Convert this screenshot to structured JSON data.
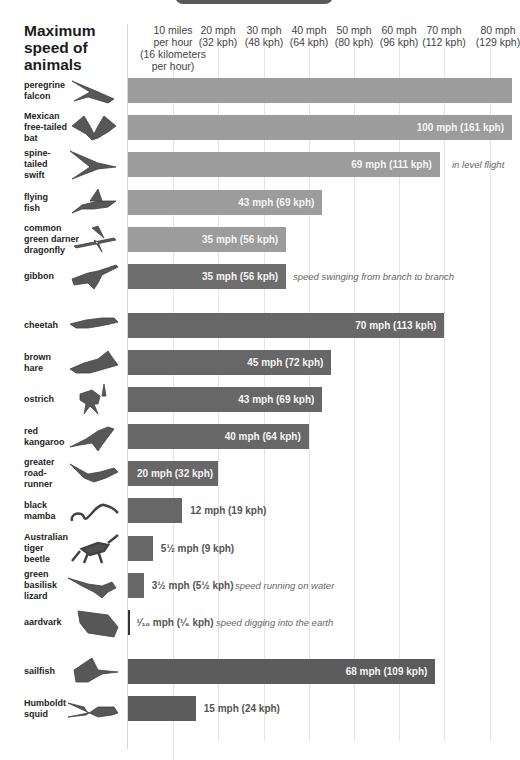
{
  "title": "Maximum speed of animals",
  "axis": {
    "ticks": [
      {
        "mph": 10,
        "label": "10 miles\nper hour\n(16 kilometers\nper hour)"
      },
      {
        "mph": 20,
        "label": "20 mph\n(32 kph)"
      },
      {
        "mph": 30,
        "label": "30 mph\n(48 kph)"
      },
      {
        "mph": 40,
        "label": "40 mph\n(64 kph)"
      },
      {
        "mph": 50,
        "label": "50 mph\n(80 kph)"
      },
      {
        "mph": 60,
        "label": "60 mph\n(96 kph)"
      },
      {
        "mph": 70,
        "label": "70 mph\n(112 kph)"
      },
      {
        "mph": 80,
        "label": "80 mph\n(129 kph)"
      }
    ]
  },
  "colors": {
    "flying_light": "#9c9c9c",
    "gibbon": "#6e6e6e",
    "land": "#676767",
    "water": "#5c5c5c",
    "grid": "#e4e4e4"
  },
  "rows": [
    {
      "name": "peregrine falcon",
      "label": "peregrine\nfalcon",
      "mph": 200,
      "text": "",
      "note": "",
      "group": "air",
      "icon": "falcon-icon"
    },
    {
      "name": "Mexican free-tailed bat",
      "label": "Mexican\nfree-tailed\nbat",
      "mph": 100,
      "text": "100 mph (161 kph)",
      "note": "",
      "group": "air",
      "icon": "bat-icon"
    },
    {
      "name": "spine-tailed swift",
      "label": "spine-\ntailed\nswift",
      "mph": 69,
      "text": "69 mph (111 kph)",
      "note": "in level flight",
      "group": "air",
      "icon": "swift-icon"
    },
    {
      "name": "flying fish",
      "label": "flying\nfish",
      "mph": 43,
      "text": "43 mph (69 kph)",
      "note": "",
      "group": "air",
      "icon": "flying-fish-icon"
    },
    {
      "name": "common green darner dragonfly",
      "label": "common\ngreen darner\ndragonfly",
      "mph": 35,
      "text": "35 mph (56 kph)",
      "note": "",
      "group": "air",
      "icon": "dragonfly-icon"
    },
    {
      "name": "gibbon",
      "label": "gibbon",
      "mph": 35,
      "text": "35 mph (56 kph)",
      "note": "speed swinging from branch to branch",
      "group": "gibbon",
      "icon": "gibbon-icon"
    },
    {
      "name": "cheetah",
      "label": "cheetah",
      "mph": 70,
      "text": "70 mph (113 kph)",
      "note": "",
      "group": "land",
      "icon": "cheetah-icon"
    },
    {
      "name": "brown hare",
      "label": "brown\nhare",
      "mph": 45,
      "text": "45 mph (72 kph)",
      "note": "",
      "group": "land",
      "icon": "hare-icon"
    },
    {
      "name": "ostrich",
      "label": "ostrich",
      "mph": 43,
      "text": "43 mph (69 kph)",
      "note": "",
      "group": "land",
      "icon": "ostrich-icon"
    },
    {
      "name": "red kangaroo",
      "label": "red\nkangaroo",
      "mph": 40,
      "text": "40 mph (64 kph)",
      "note": "",
      "group": "land",
      "icon": "kangaroo-icon"
    },
    {
      "name": "greater roadrunner",
      "label": "greater\nroad-\nrunner",
      "mph": 20,
      "text": "20 mph (32 kph)",
      "note": "",
      "group": "land",
      "icon": "roadrunner-icon"
    },
    {
      "name": "black mamba",
      "label": "black\nmamba",
      "mph": 12,
      "text": "12 mph (19 kph)",
      "note": "",
      "group": "land",
      "icon": "snake-icon"
    },
    {
      "name": "Australian tiger beetle",
      "label": "Australian\ntiger\nbeetle",
      "mph": 5.5,
      "text": "5½ mph (9 kph)",
      "note": "",
      "group": "land",
      "icon": "beetle-icon"
    },
    {
      "name": "green basilisk lizard",
      "label": "green\nbasilisk\nlizard",
      "mph": 3.5,
      "text": "3½ mph (5½ kph)",
      "note": "speed running on water",
      "group": "land",
      "icon": "lizard-icon"
    },
    {
      "name": "aardvark",
      "label": "aardvark",
      "mph": 0.1,
      "text": "¹⁄₁₀ mph (¹⁄₆ kph)",
      "note": "speed digging into the earth",
      "group": "land",
      "icon": "aardvark-icon"
    },
    {
      "name": "sailfish",
      "label": "sailfish",
      "mph": 68,
      "text": "68 mph (109 kph)",
      "note": "",
      "group": "water",
      "icon": "sailfish-icon"
    },
    {
      "name": "Humboldt squid",
      "label": "Humboldt\nsquid",
      "mph": 15,
      "text": "15 mph (24 kph)",
      "note": "",
      "group": "water",
      "icon": "squid-icon"
    }
  ],
  "chart_data": {
    "type": "bar",
    "orientation": "horizontal",
    "title": "Maximum speed of animals",
    "xlabel": "speed (mph / kph)",
    "ylabel": "",
    "xlim": [
      0,
      84
    ],
    "grid": true,
    "x_tick_labels": [
      "10 miles per hour (16 kilometers per hour)",
      "20 mph (32 kph)",
      "30 mph (48 kph)",
      "40 mph (64 kph)",
      "50 mph (80 kph)",
      "60 mph (96 kph)",
      "70 mph (112 kph)",
      "80 mph (129 kph)"
    ],
    "categories": [
      "peregrine falcon",
      "Mexican free-tailed bat",
      "spine-tailed swift",
      "flying fish",
      "common green darner dragonfly",
      "gibbon",
      "cheetah",
      "brown hare",
      "ostrich",
      "red kangaroo",
      "greater roadrunner",
      "black mamba",
      "Australian tiger beetle",
      "green basilisk lizard",
      "aardvark",
      "sailfish",
      "Humboldt squid"
    ],
    "series": [
      {
        "name": "max speed (mph)",
        "values": [
          200,
          100,
          69,
          43,
          35,
          35,
          70,
          45,
          43,
          40,
          20,
          12,
          5.5,
          3.5,
          0.1,
          68,
          15
        ]
      },
      {
        "name": "max speed (kph)",
        "values": [
          null,
          161,
          111,
          69,
          56,
          56,
          113,
          72,
          69,
          64,
          32,
          19,
          9,
          5.5,
          0.1667,
          109,
          24
        ]
      }
    ],
    "data_labels": [
      "",
      "100 mph (161 kph)",
      "69 mph (111 kph)",
      "43 mph (69 kph)",
      "35 mph (56 kph)",
      "35 mph (56 kph)",
      "70 mph (113 kph)",
      "45 mph (72 kph)",
      "43 mph (69 kph)",
      "40 mph (64 kph)",
      "20 mph (32 kph)",
      "12 mph (19 kph)",
      "5½ mph (9 kph)",
      "3½ mph (5½ kph)",
      "1/10 mph (1/6 kph)",
      "68 mph (109 kph)",
      "15 mph (24 kph)"
    ],
    "annotations": [
      {
        "category": "spine-tailed swift",
        "text": "in level flight"
      },
      {
        "category": "gibbon",
        "text": "speed swinging from branch to branch"
      },
      {
        "category": "green basilisk lizard",
        "text": "speed running on water"
      },
      {
        "category": "aardvark",
        "text": "speed digging into the earth"
      }
    ]
  }
}
